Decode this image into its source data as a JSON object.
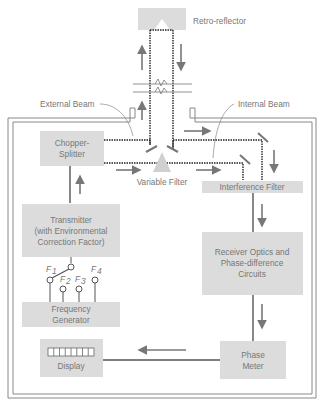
{
  "labels": {
    "retro_reflector": "Retro-reflector",
    "external_beam": "External Beam",
    "internal_beam": "Internal Beam",
    "variable_filter": "Variable Filter",
    "interference_filter": "Interference Filter",
    "chopper_splitter": [
      "Chopper-",
      "Splitter"
    ],
    "transmitter": [
      "Transmitter",
      "(with Environmental",
      "Correction Factor)"
    ],
    "receiver": [
      "Receiver Optics and",
      "Phase-difference",
      "Circuits"
    ],
    "frequency_generator": [
      "Frequency",
      "Generator"
    ],
    "display": "Display",
    "phase_meter": [
      "Phase",
      "Meter"
    ],
    "frequencies": [
      "F",
      "F",
      "F",
      "F"
    ],
    "frequency_subscripts": [
      "1",
      "2",
      "3",
      "4"
    ]
  },
  "colors": {
    "box_fill": "#dcdcdc",
    "line": "#555555",
    "arrow": "#777777",
    "text": "#777777"
  }
}
